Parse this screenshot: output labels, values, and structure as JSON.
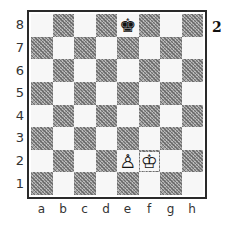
{
  "diagram": {
    "number": "2",
    "files": [
      "a",
      "b",
      "c",
      "d",
      "e",
      "f",
      "g",
      "h"
    ],
    "ranks": [
      "8",
      "7",
      "6",
      "5",
      "4",
      "3",
      "2",
      "1"
    ],
    "pieces": [
      {
        "square": "e8",
        "piece": "king",
        "color": "black",
        "glyph": "♚"
      },
      {
        "square": "e2",
        "piece": "pawn",
        "color": "white",
        "glyph": "♙"
      },
      {
        "square": "f2",
        "piece": "king",
        "color": "white",
        "glyph": "♔"
      }
    ],
    "colors": {
      "light_square": "#f7f7f7",
      "dark_square": "#9a9a9a",
      "frame": "#2a2a2a"
    }
  }
}
